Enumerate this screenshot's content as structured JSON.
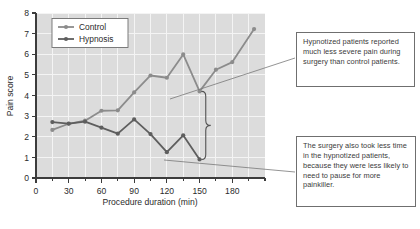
{
  "chart_data": {
    "type": "line",
    "title": "",
    "xlabel": "Procedure duration (min)",
    "ylabel": "Pain score",
    "xlim": [
      0,
      210
    ],
    "ylim": [
      0,
      8
    ],
    "xticks": [
      0,
      30,
      60,
      90,
      120,
      150,
      180
    ],
    "yticks": [
      0,
      1,
      2,
      3,
      4,
      5,
      6,
      7,
      8
    ],
    "minor_xtick_interval": 15,
    "grid": true,
    "legend_position": "top-left",
    "series": [
      {
        "name": "Control",
        "color": "#8c8c8c",
        "x": [
          15,
          30,
          45,
          60,
          75,
          90,
          105,
          120,
          135,
          150,
          165,
          180,
          200
        ],
        "values": [
          2.33,
          2.63,
          2.78,
          3.26,
          3.28,
          4.15,
          4.97,
          4.86,
          5.99,
          4.2,
          5.25,
          5.62,
          7.22
        ]
      },
      {
        "name": "Hypnosis",
        "color": "#5e5e5e",
        "x": [
          15,
          30,
          45,
          60,
          75,
          90,
          105,
          120,
          135,
          150
        ],
        "values": [
          2.71,
          2.64,
          2.73,
          2.44,
          2.15,
          2.84,
          2.13,
          1.25,
          2.07,
          0.9
        ]
      }
    ],
    "annotations": [
      {
        "id": "gap-brace",
        "type": "brace",
        "x": 152,
        "y_top": 4.2,
        "y_bottom": 0.9
      }
    ]
  },
  "legend": {
    "entries": [
      {
        "label": "Control"
      },
      {
        "label": "Hypnosis"
      }
    ]
  },
  "axes": {
    "x_title": "Procedure duration (min)",
    "y_title": "Pain score",
    "x_tick_labels": [
      "0",
      "30",
      "60",
      "90",
      "120",
      "150",
      "180"
    ],
    "y_tick_labels": [
      "0",
      "1",
      "2",
      "3",
      "4",
      "5",
      "6",
      "7",
      "8"
    ]
  },
  "annotations": {
    "box1": "Hypnotized patients reported much less severe pain during surgery than control patients.",
    "box2": "The surgery also took less time in the hypnotized patients, because they were less likely to need to pause for more painkiller."
  },
  "colors": {
    "control": "#8c8c8c",
    "hypnosis": "#5e5e5e",
    "plot_background": "#dcdcdc",
    "gridline": "#f2f2f2",
    "axis": "#3c3c3c",
    "annotation_border": "#6f6f6f",
    "leader_line": "#707070"
  }
}
